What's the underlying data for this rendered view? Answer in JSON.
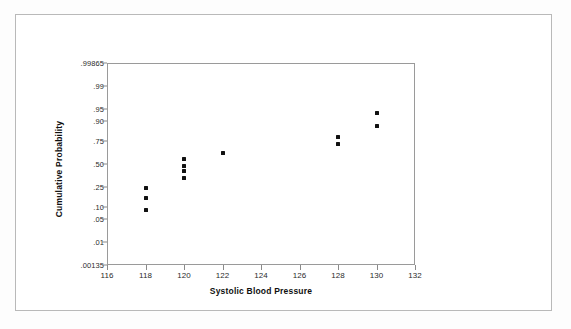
{
  "chart_data": {
    "type": "scatter",
    "title": "",
    "xlabel": "Systolic Blood Pressure",
    "ylabel": "Cumulative Probability",
    "xlim": [
      116,
      132
    ],
    "x_ticks": [
      116,
      118,
      120,
      122,
      124,
      126,
      128,
      130,
      132
    ],
    "x_tick_labels": [
      "116",
      "118",
      "120",
      "122",
      "124",
      "126",
      "128",
      "130",
      "132"
    ],
    "y_scale": "normal-probability",
    "y_ticks": [
      0.00135,
      0.01,
      0.05,
      0.1,
      0.25,
      0.5,
      0.75,
      0.9,
      0.95,
      0.99,
      0.99865
    ],
    "y_tick_labels": [
      ".00135",
      ".01",
      ".05",
      ".10",
      ".25",
      ".50",
      ".75",
      ".90",
      ".95",
      ".99",
      ".99865"
    ],
    "ylim": [
      0.00135,
      0.99865
    ],
    "grid": false,
    "legend": null,
    "series": [
      {
        "name": "Cumulative probability of systolic blood pressure",
        "marker": "filled-square",
        "color": "#111111",
        "points": [
          {
            "x": 118,
            "y": 0.085
          },
          {
            "x": 118,
            "y": 0.155
          },
          {
            "x": 118,
            "y": 0.24
          },
          {
            "x": 120,
            "y": 0.335
          },
          {
            "x": 120,
            "y": 0.415
          },
          {
            "x": 120,
            "y": 0.48
          },
          {
            "x": 120,
            "y": 0.555
          },
          {
            "x": 122,
            "y": 0.625
          },
          {
            "x": 128,
            "y": 0.72
          },
          {
            "x": 128,
            "y": 0.79
          },
          {
            "x": 130,
            "y": 0.87
          },
          {
            "x": 130,
            "y": 0.935
          }
        ]
      }
    ]
  }
}
